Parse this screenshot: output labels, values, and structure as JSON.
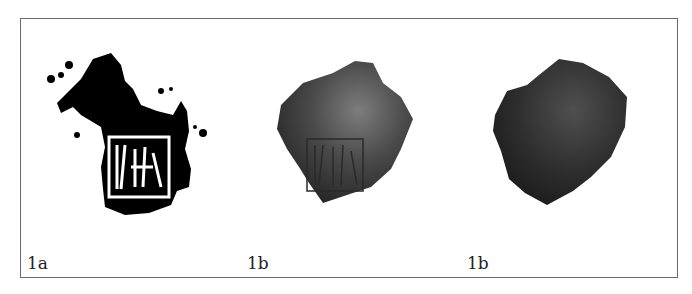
{
  "figure": {
    "panels": [
      {
        "id": "1a",
        "label": "1a",
        "description": "black-and-white rubbing of stamped inscription on sherd"
      },
      {
        "id": "1b-front",
        "label": "1b",
        "description": "photograph of sherd front with stamped inscription"
      },
      {
        "id": "1b-back",
        "label": "1b",
        "description": "photograph of sherd reverse side"
      }
    ]
  }
}
